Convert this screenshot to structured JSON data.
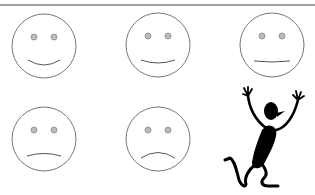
{
  "colors": {
    "background": "#ffffff",
    "rule": "#444444",
    "face_outline": "#666666",
    "eye_fill": "#bbbbbb",
    "eye_stroke": "#888888",
    "mouth": "#555555",
    "figure": "#000000"
  },
  "top_rule": {
    "y": 5
  },
  "faces": [
    {
      "name": "very-happy",
      "cx": 44,
      "cy": 46,
      "r": 32,
      "mouth_curve": 8
    },
    {
      "name": "slightly-happy",
      "cx": 158,
      "cy": 45,
      "r": 32,
      "mouth_curve": 3
    },
    {
      "name": "neutral",
      "cx": 272,
      "cy": 45,
      "r": 32,
      "mouth_curve": 1
    },
    {
      "name": "slightly-sad",
      "cx": 44,
      "cy": 139,
      "r": 32,
      "mouth_curve": -4
    },
    {
      "name": "sad",
      "cx": 158,
      "cy": 139,
      "r": 32,
      "mouth_curve": -8
    }
  ],
  "figure": {
    "name": "jumping-stick-figure"
  }
}
